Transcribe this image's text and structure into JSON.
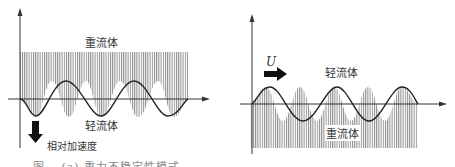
{
  "left_panel": {
    "heavy_label": "重流体",
    "light_label": "轻流体",
    "accel_label": "相对加速度"
  },
  "right_panel": {
    "velocity_label": "U",
    "light_label": "轻流体",
    "heavy_label": "重流体"
  },
  "caption": {
    "left": "图… (a) 重力不稳定性模式",
    "right": ""
  },
  "colors": {
    "hatch": "#9a9a9a",
    "line": "#222222",
    "arrow": "#111111"
  }
}
